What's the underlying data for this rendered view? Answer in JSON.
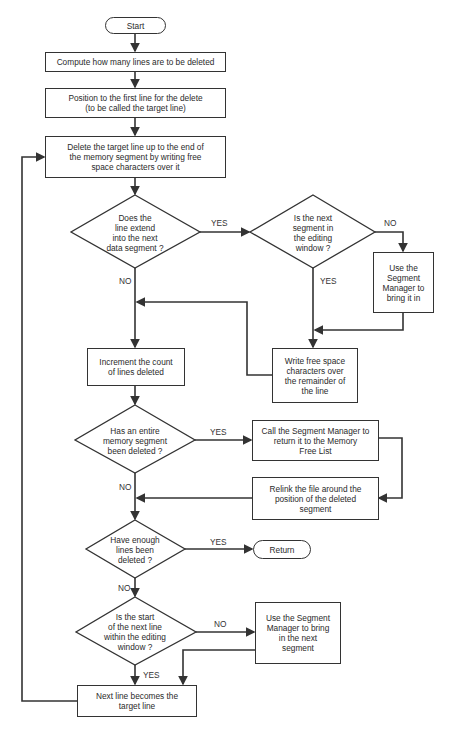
{
  "flowchart": {
    "start": "Start",
    "compute": "Compute how many lines are to be deleted",
    "position": "Position to the first line for the delete\n(to be called the target line)",
    "delete": "Delete the target line up to the end of\nthe memory segment by writing free\nspace characters over it",
    "decision_extend": "Does the\nline extend\ninto the next\ndata segment ?",
    "decision_next_in_window": "Is the next\nsegment in\nthe editing\nwindow ?",
    "use_segment_manager_bring_in": "Use the\nSegment\nManager to\nbring it in",
    "write_free_space": "Write free space\ncharacters over\nthe remainder of\nthe line",
    "increment_count": "Increment the count\nof lines deleted",
    "decision_segment_deleted": "Has an entire\nmemory segment\nbeen deleted ?",
    "call_segment_manager_return": "Call the Segment Manager to\nreturn it to the Memory\nFree List",
    "relink_file": "Relink the file around the\nposition of the deleted\nsegment",
    "decision_enough_lines": "Have enough\nlines been\ndeleted ?",
    "return": "Return",
    "decision_start_in_window": "Is the start\nof the next line\nwithin the editing\nwindow ?",
    "use_segment_manager_next": "Use the Segment\nManager to bring\nin the next\nsegment",
    "next_line_target": "Next line becomes the\ntarget line"
  },
  "labels": {
    "yes_extend": "YES",
    "no_extend": "NO",
    "no_window": "NO",
    "yes_window": "YES",
    "yes_segment_deleted": "YES",
    "no_segment_deleted": "NO",
    "yes_enough": "YES",
    "no_enough": "NO",
    "no_start_window": "NO",
    "yes_start_window": "YES"
  }
}
